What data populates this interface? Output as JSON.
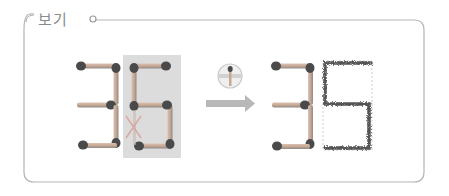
{
  "panel": {
    "title": "보기",
    "border_color": "#b5b5b5",
    "bullet_color": "#9a9a9a"
  },
  "colors": {
    "match_stick": "#c8a893",
    "match_stick_shadow": "#9c8a80",
    "match_head": "#4a4a4a",
    "highlight_box": "#dcdcdc",
    "arrow": "#b8b8b8",
    "cross_mark": "#d9a9a0",
    "burnt": "#555555",
    "dashed_guide": "#c0c0c0"
  },
  "figure": {
    "before": {
      "digits": [
        "3",
        "6"
      ],
      "highlighted_digit": "6",
      "removed_segment": "lower-left of 6"
    },
    "action_icon": "move-one-match-icon",
    "after": {
      "digits": [
        "3",
        "5"
      ],
      "changed_digit": "5",
      "style": "burnt outline"
    }
  }
}
